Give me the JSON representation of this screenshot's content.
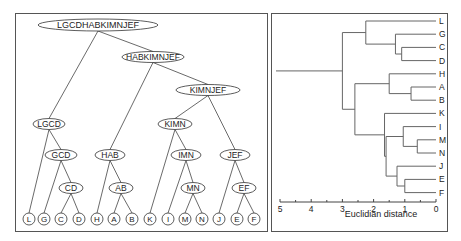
{
  "tree_panel": {
    "root": "LGCDHABKIMNJEF",
    "internal_nodes": [
      {
        "id": "root",
        "label": "LGCDHABKIMNJEF",
        "cx": 98,
        "cy": 25,
        "rx": 60,
        "ry": 6
      },
      {
        "id": "habkimnjef",
        "label": "HABKIMNJEF",
        "cx": 153,
        "cy": 57,
        "rx": 31,
        "ry": 5.5
      },
      {
        "id": "kimnjef",
        "label": "KIMNJEF",
        "cx": 208,
        "cy": 90,
        "rx": 32,
        "ry": 5.5
      },
      {
        "id": "lgcd",
        "label": "LGCD",
        "cx": 49,
        "cy": 124,
        "rx": 16,
        "ry": 5.5
      },
      {
        "id": "kimn",
        "label": "KIMN",
        "cx": 175,
        "cy": 124,
        "rx": 17,
        "ry": 5.5
      },
      {
        "id": "gcd",
        "label": "GCD",
        "cx": 61,
        "cy": 155,
        "rx": 16,
        "ry": 5.5
      },
      {
        "id": "hab",
        "label": "HAB",
        "cx": 110,
        "cy": 155,
        "rx": 15,
        "ry": 5.5
      },
      {
        "id": "imn",
        "label": "IMN",
        "cx": 186,
        "cy": 155,
        "rx": 15,
        "ry": 5.5
      },
      {
        "id": "jef",
        "label": "JEF",
        "cx": 235,
        "cy": 155,
        "rx": 15,
        "ry": 5.5
      },
      {
        "id": "cd",
        "label": "CD",
        "cx": 71,
        "cy": 188,
        "rx": 12,
        "ry": 5.5
      },
      {
        "id": "ab",
        "label": "AB",
        "cx": 121,
        "cy": 188,
        "rx": 12,
        "ry": 5.5
      },
      {
        "id": "mn",
        "label": "MN",
        "cx": 193,
        "cy": 188,
        "rx": 12,
        "ry": 5.5
      },
      {
        "id": "ef",
        "label": "EF",
        "cx": 244,
        "cy": 188,
        "rx": 12,
        "ry": 5.5
      }
    ],
    "leaves": [
      {
        "label": "L",
        "cx": 29
      },
      {
        "label": "G",
        "cx": 44
      },
      {
        "label": "C",
        "cx": 61
      },
      {
        "label": "D",
        "cx": 79
      },
      {
        "label": "H",
        "cx": 97
      },
      {
        "label": "A",
        "cx": 114
      },
      {
        "label": "B",
        "cx": 132
      },
      {
        "label": "K",
        "cx": 150
      },
      {
        "label": "I",
        "cx": 168
      },
      {
        "label": "M",
        "cx": 185
      },
      {
        "label": "N",
        "cx": 202
      },
      {
        "label": "J",
        "cx": 219
      },
      {
        "label": "E",
        "cx": 237
      },
      {
        "label": "F",
        "cx": 254
      }
    ],
    "leaf_y": 219,
    "edges": [
      [
        "root",
        "lgcd"
      ],
      [
        "root",
        "habkimnjef"
      ],
      [
        "habkimnjef",
        "hab"
      ],
      [
        "habkimnjef",
        "kimnjef"
      ],
      [
        "kimnjef",
        "kimn"
      ],
      [
        "kimnjef",
        "jef"
      ],
      [
        "lgcd",
        "L"
      ],
      [
        "lgcd",
        "gcd"
      ],
      [
        "gcd",
        "G"
      ],
      [
        "gcd",
        "cd"
      ],
      [
        "cd",
        "C"
      ],
      [
        "cd",
        "D"
      ],
      [
        "hab",
        "H"
      ],
      [
        "hab",
        "ab"
      ],
      [
        "ab",
        "A"
      ],
      [
        "ab",
        "B"
      ],
      [
        "kimn",
        "K"
      ],
      [
        "kimn",
        "imn"
      ],
      [
        "imn",
        "I"
      ],
      [
        "imn",
        "mn"
      ],
      [
        "mn",
        "M"
      ],
      [
        "mn",
        "N"
      ],
      [
        "jef",
        "J"
      ],
      [
        "jef",
        "ef"
      ],
      [
        "ef",
        "E"
      ],
      [
        "ef",
        "F"
      ]
    ]
  },
  "dendrogram_panel": {
    "axis_label": "Euclidian distance",
    "ticks": [
      "5",
      "4",
      "3",
      "2",
      "1",
      "0"
    ],
    "leaf_order": [
      "L",
      "G",
      "C",
      "D",
      "H",
      "A",
      "B",
      "K",
      "I",
      "M",
      "N",
      "J",
      "E",
      "F"
    ]
  },
  "chart_data": {
    "type": "dendrogram",
    "title": "",
    "xlabel": "Euclidian distance",
    "xlim": [
      5,
      0
    ],
    "x_ticks": [
      5,
      4,
      3,
      2,
      1,
      0
    ],
    "leaves": [
      "L",
      "G",
      "C",
      "D",
      "H",
      "A",
      "B",
      "K",
      "I",
      "M",
      "N",
      "J",
      "E",
      "F"
    ],
    "merges": [
      {
        "cluster": "MN",
        "children": [
          "M",
          "N"
        ],
        "height": 0.6
      },
      {
        "cluster": "AB",
        "children": [
          "A",
          "B"
        ],
        "height": 0.8
      },
      {
        "cluster": "EF",
        "children": [
          "E",
          "F"
        ],
        "height": 1.0
      },
      {
        "cluster": "IMN",
        "children": [
          "I",
          "MN"
        ],
        "height": 1.05
      },
      {
        "cluster": "CD",
        "children": [
          "C",
          "D"
        ],
        "height": 1.1
      },
      {
        "cluster": "JEF",
        "children": [
          "J",
          "EF"
        ],
        "height": 1.25
      },
      {
        "cluster": "GCD",
        "children": [
          "G",
          "CD"
        ],
        "height": 1.3
      },
      {
        "cluster": "HAB",
        "children": [
          "H",
          "AB"
        ],
        "height": 1.5
      },
      {
        "cluster": "IMNJEF",
        "children": [
          "IMN",
          "JEF"
        ],
        "height": 1.6
      },
      {
        "cluster": "KIMNJEF",
        "children": [
          "K",
          "IMNJEF"
        ],
        "height": 1.65
      },
      {
        "cluster": "LGCD",
        "children": [
          "L",
          "GCD"
        ],
        "height": 2.25
      },
      {
        "cluster": "HABKIMNJEF",
        "children": [
          "HAB",
          "KIMNJEF"
        ],
        "height": 2.6
      },
      {
        "cluster": "LGCDHABKIMNJEF",
        "children": [
          "LGCD",
          "HABKIMNJEF"
        ],
        "height": 3.0
      }
    ],
    "root_stub_to": 5.0,
    "grid": false,
    "legend": null
  }
}
